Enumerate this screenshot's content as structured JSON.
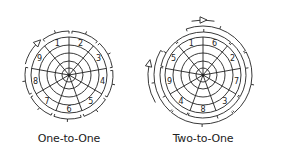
{
  "diagrams": [
    {
      "caption": "One-to-One",
      "sector_labels": [
        "1",
        "2",
        "3",
        "4",
        "5",
        "6",
        "7",
        "8",
        "9"
      ],
      "stroke_color": "#222222"
    },
    {
      "caption": "Two-to-One",
      "sector_labels": [
        "1",
        "6",
        "2",
        "7",
        "3",
        "8",
        "4",
        "9",
        "5"
      ],
      "stroke_color": "#222222"
    }
  ]
}
